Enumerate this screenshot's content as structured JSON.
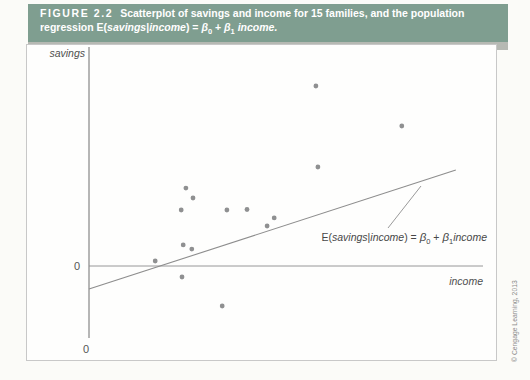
{
  "figure_header": {
    "label": "FIGURE 2.2",
    "line1": "Scatterplot of savings and income for 15 families, and the population",
    "line2": {
      "pre": "regression E(",
      "var1": "savings",
      "bar": "|",
      "var2": "income",
      "mid": ") = ",
      "beta1": "β",
      "sub0": "0",
      "plus": " + ",
      "beta2": "β",
      "sub1": "1",
      "end": " income."
    }
  },
  "plot": {
    "ylabel": "savings",
    "xlabel": "income",
    "y_zero_label": "0",
    "x_origin_label": "0",
    "equation": {
      "e_open": "E(",
      "var1": "savings",
      "bar": "|",
      "var2": "income",
      "equals": ") = ",
      "beta1": "β",
      "sub0": "0",
      "plus": " + ",
      "beta2": "β",
      "sub1": "1",
      "var3": "income"
    },
    "credit": "© Cengage Learning, 2013"
  },
  "chart_data": {
    "type": "scatter",
    "xlabel": "income",
    "ylabel": "savings",
    "n_points": 15,
    "axes_note": "No numeric tick labels shown; only 0 marked on each axis. Values below are in relative plot units: income 0–100 spans the horizontal axis, savings 0 at the zero line, 100 at the highest point.",
    "points": [
      {
        "income": 16.8,
        "savings": 2.8
      },
      {
        "income": 23.4,
        "savings": 31.1
      },
      {
        "income": 23.6,
        "savings": -6.1
      },
      {
        "income": 23.9,
        "savings": 11.7
      },
      {
        "income": 24.6,
        "savings": 43.3
      },
      {
        "income": 26.1,
        "savings": 9.4
      },
      {
        "income": 26.4,
        "savings": 37.8
      },
      {
        "income": 33.8,
        "savings": -22.2
      },
      {
        "income": 35.0,
        "savings": 31.1
      },
      {
        "income": 40.1,
        "savings": 31.4
      },
      {
        "income": 45.2,
        "savings": 22.2
      },
      {
        "income": 47.0,
        "savings": 26.7
      },
      {
        "income": 57.6,
        "savings": 100.0
      },
      {
        "income": 58.1,
        "savings": 55.0
      },
      {
        "income": 79.4,
        "savings": 77.8
      }
    ],
    "regression_line": {
      "x1": 0,
      "y1": -12.8,
      "x2": 93.1,
      "y2": 53.3,
      "intercept_sign": "negative",
      "slope_sign": "positive"
    },
    "legend": "none",
    "grid": false
  },
  "colors": {
    "header_teal": "#7f9e90",
    "header_shadow": "#b6b9b3",
    "header_text": "#ffffff",
    "frame_border": "#c8c8c8",
    "frame_fill": "#fefefd",
    "axis_gray": "#6e6e6e",
    "line_gray": "#8d8d8d",
    "point_gray": "#8f9091",
    "label_gray": "#555555"
  }
}
